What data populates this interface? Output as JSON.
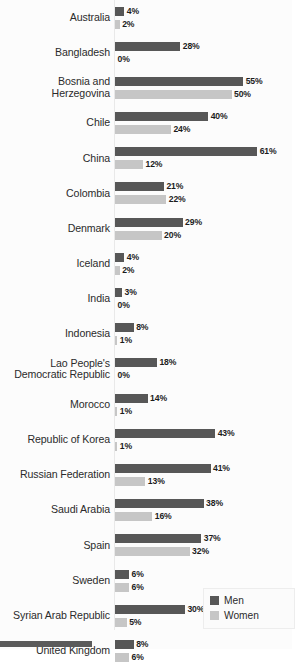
{
  "chart_data": {
    "type": "bar",
    "orientation": "horizontal",
    "title": "",
    "subtitle": "",
    "xlabel": "",
    "ylabel": "",
    "xlim": [
      0,
      65
    ],
    "grid": false,
    "value_suffix": "%",
    "legend_position": "bottom-right",
    "categories": [
      "Australia",
      "Bangladesh",
      "Bosnia and\nHerzegovina",
      "Chile",
      "China",
      "Colombia",
      "Denmark",
      "Iceland",
      "India",
      "Indonesia",
      "Lao People's\nDemocratic Republic",
      "Morocco",
      "Republic of Korea",
      "Russian Federation",
      "Saudi Arabia",
      "Spain",
      "Sweden",
      "Syrian Arab Republic",
      "United Kingdom"
    ],
    "series": [
      {
        "name": "Men",
        "color": "#575757",
        "values": [
          4,
          28,
          55,
          40,
          61,
          21,
          29,
          4,
          3,
          8,
          18,
          14,
          43,
          41,
          38,
          37,
          6,
          30,
          8
        ],
        "labels": [
          "4%",
          "28%",
          "55%",
          "40%",
          "61%",
          "21%",
          "29%",
          "4%",
          "3%",
          "8%",
          "18%",
          "14%",
          "43%",
          "41%",
          "38%",
          "37%",
          "6%",
          "30%",
          "8%"
        ]
      },
      {
        "name": "Women",
        "color": "#c6c6c6",
        "values": [
          2,
          0,
          50,
          24,
          12,
          22,
          20,
          2,
          0,
          1,
          0,
          1,
          1,
          13,
          16,
          32,
          6,
          5,
          6
        ],
        "labels": [
          "2%",
          "0%",
          "50%",
          "24%",
          "12%",
          "22%",
          "20%",
          "2%",
          "0%",
          "1%",
          "0%",
          "1%",
          "1%",
          "13%",
          "16%",
          "32%",
          "6%",
          "5%",
          "6%"
        ]
      }
    ],
    "legend": [
      {
        "label": "Men",
        "color": "#575757"
      },
      {
        "label": "Women",
        "color": "#c6c6c6"
      }
    ]
  },
  "rows": [
    {
      "label": "Australia",
      "men": {
        "value": 4,
        "text": "4%"
      },
      "women": {
        "value": 2,
        "text": "2%"
      }
    },
    {
      "label": "Bangladesh",
      "men": {
        "value": 28,
        "text": "28%"
      },
      "women": {
        "value": 0,
        "text": "0%"
      }
    },
    {
      "label": "Bosnia and\nHerzegovina",
      "men": {
        "value": 55,
        "text": "55%"
      },
      "women": {
        "value": 50,
        "text": "50%"
      }
    },
    {
      "label": "Chile",
      "men": {
        "value": 40,
        "text": "40%"
      },
      "women": {
        "value": 24,
        "text": "24%"
      }
    },
    {
      "label": "China",
      "men": {
        "value": 61,
        "text": "61%"
      },
      "women": {
        "value": 12,
        "text": "12%"
      }
    },
    {
      "label": "Colombia",
      "men": {
        "value": 21,
        "text": "21%"
      },
      "women": {
        "value": 22,
        "text": "22%"
      }
    },
    {
      "label": "Denmark",
      "men": {
        "value": 29,
        "text": "29%"
      },
      "women": {
        "value": 20,
        "text": "20%"
      }
    },
    {
      "label": "Iceland",
      "men": {
        "value": 4,
        "text": "4%"
      },
      "women": {
        "value": 2,
        "text": "2%"
      }
    },
    {
      "label": "India",
      "men": {
        "value": 3,
        "text": "3%"
      },
      "women": {
        "value": 0,
        "text": "0%"
      }
    },
    {
      "label": "Indonesia",
      "men": {
        "value": 8,
        "text": "8%"
      },
      "women": {
        "value": 1,
        "text": "1%"
      }
    },
    {
      "label": "Lao People's\nDemocratic Republic",
      "men": {
        "value": 18,
        "text": "18%"
      },
      "women": {
        "value": 0,
        "text": "0%"
      }
    },
    {
      "label": "Morocco",
      "men": {
        "value": 14,
        "text": "14%"
      },
      "women": {
        "value": 1,
        "text": "1%"
      }
    },
    {
      "label": "Republic of Korea",
      "men": {
        "value": 43,
        "text": "43%"
      },
      "women": {
        "value": 1,
        "text": "1%"
      }
    },
    {
      "label": "Russian Federation",
      "men": {
        "value": 41,
        "text": "41%"
      },
      "women": {
        "value": 13,
        "text": "13%"
      }
    },
    {
      "label": "Saudi Arabia",
      "men": {
        "value": 38,
        "text": "38%"
      },
      "women": {
        "value": 16,
        "text": "16%"
      }
    },
    {
      "label": "Spain",
      "men": {
        "value": 37,
        "text": "37%"
      },
      "women": {
        "value": 32,
        "text": "32%"
      }
    },
    {
      "label": "Sweden",
      "men": {
        "value": 6,
        "text": "6%"
      },
      "women": {
        "value": 6,
        "text": "6%"
      }
    },
    {
      "label": "Syrian Arab Republic",
      "men": {
        "value": 30,
        "text": "30%"
      },
      "women": {
        "value": 5,
        "text": "5%"
      }
    },
    {
      "label": "United Kingdom",
      "men": {
        "value": 8,
        "text": "8%"
      },
      "women": {
        "value": 6,
        "text": "6%"
      }
    }
  ],
  "legend": {
    "men_label": "Men",
    "women_label": "Women",
    "men_color": "#575757",
    "women_color": "#c6c6c6"
  },
  "scale": {
    "px_per_percent": 2.33,
    "origin_x": 115
  }
}
